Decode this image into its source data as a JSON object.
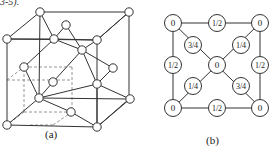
{
  "caption_fragment": "3-5).",
  "panel_a": {
    "label": "(a)",
    "title": "Diamond cubic unit cell (3D perspective)",
    "solid_edges": [
      [
        7,
        39,
        97,
        40
      ],
      [
        97,
        40,
        97,
        127
      ],
      [
        97,
        127,
        7,
        125
      ],
      [
        7,
        125,
        7,
        39
      ],
      [
        40,
        12,
        129,
        12
      ],
      [
        129,
        12,
        129,
        99
      ],
      [
        129,
        99,
        39,
        98
      ],
      [
        39,
        98,
        40,
        12
      ],
      [
        7,
        39,
        40,
        12
      ],
      [
        97,
        40,
        129,
        12
      ],
      [
        97,
        127,
        129,
        99
      ],
      [
        7,
        125,
        39,
        98
      ],
      [
        40,
        12,
        54,
        39
      ],
      [
        7,
        39,
        54,
        39
      ],
      [
        54,
        39,
        97,
        40
      ],
      [
        54,
        39,
        66,
        25
      ],
      [
        66,
        25,
        82,
        50
      ],
      [
        54,
        39,
        82,
        50
      ],
      [
        82,
        50,
        113,
        68
      ],
      [
        82,
        50,
        97,
        84
      ],
      [
        54,
        39,
        24,
        67
      ],
      [
        24,
        67,
        39,
        98
      ],
      [
        97,
        40,
        82,
        50
      ],
      [
        82,
        50,
        53,
        82
      ],
      [
        53,
        82,
        39,
        98
      ],
      [
        39,
        98,
        71,
        112
      ],
      [
        71,
        112,
        97,
        127
      ],
      [
        39,
        98,
        97,
        84
      ],
      [
        97,
        84,
        130,
        99
      ],
      [
        97,
        84,
        113,
        68
      ],
      [
        130,
        99,
        97,
        127
      ],
      [
        129,
        12,
        97,
        40
      ],
      [
        97,
        84,
        97,
        127
      ]
    ],
    "dashed_edges": [
      [
        24,
        67,
        72,
        67
      ],
      [
        72,
        67,
        72,
        112
      ],
      [
        72,
        112,
        24,
        112
      ],
      [
        24,
        112,
        24,
        67
      ],
      [
        7,
        80,
        24,
        67
      ],
      [
        7,
        80,
        7,
        80
      ],
      [
        24,
        112,
        7,
        125
      ],
      [
        72,
        112,
        53,
        125
      ],
      [
        53,
        125,
        30,
        125
      ],
      [
        7,
        80,
        72,
        80
      ]
    ],
    "nodes": [
      [
        40,
        12
      ],
      [
        129,
        12
      ],
      [
        7,
        39
      ],
      [
        54,
        39
      ],
      [
        97,
        40
      ],
      [
        66,
        25
      ],
      [
        82,
        50
      ],
      [
        113,
        68
      ],
      [
        24,
        67
      ],
      [
        53,
        82
      ],
      [
        97,
        84
      ],
      [
        39,
        98
      ],
      [
        130,
        99
      ],
      [
        71,
        112
      ],
      [
        7,
        125
      ],
      [
        97,
        127
      ]
    ],
    "node_radius": 4.2
  },
  "panel_b": {
    "label": "(b)",
    "title": "Projected atom heights on cube face",
    "edges": [
      [
        173,
        23,
        260,
        23
      ],
      [
        260,
        23,
        260,
        108
      ],
      [
        260,
        108,
        173,
        108
      ],
      [
        173,
        108,
        173,
        23
      ],
      [
        173,
        23,
        261,
        108
      ],
      [
        260,
        23,
        173,
        108
      ]
    ],
    "nodes": [
      {
        "x": 173,
        "y": 23,
        "text": "0"
      },
      {
        "x": 217,
        "y": 23,
        "text": "1/2"
      },
      {
        "x": 260,
        "y": 23,
        "text": "0"
      },
      {
        "x": 193,
        "y": 45,
        "text": "3/4"
      },
      {
        "x": 241,
        "y": 45,
        "text": "1/4"
      },
      {
        "x": 173,
        "y": 65,
        "text": "1/2"
      },
      {
        "x": 217,
        "y": 65,
        "text": "0"
      },
      {
        "x": 260,
        "y": 65,
        "text": "1/2"
      },
      {
        "x": 193,
        "y": 86,
        "text": "1/4"
      },
      {
        "x": 241,
        "y": 86,
        "text": "3/4"
      },
      {
        "x": 173,
        "y": 108,
        "text": "0"
      },
      {
        "x": 217,
        "y": 108,
        "text": "1/2"
      },
      {
        "x": 260,
        "y": 108,
        "text": "0"
      }
    ],
    "node_radius": 8.5
  },
  "colors": {
    "line": "#333333",
    "dashed": "#8a8a8a",
    "node_fill": "#ffffff",
    "text": "#222222"
  }
}
